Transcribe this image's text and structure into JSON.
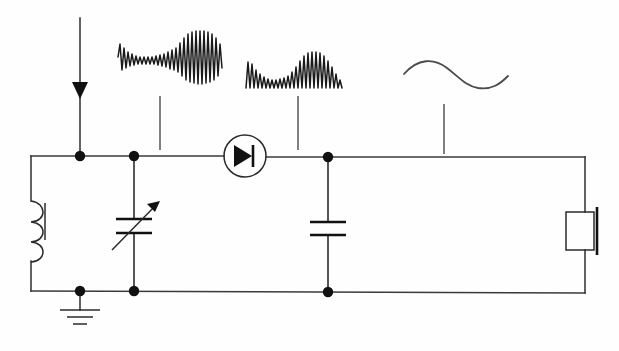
{
  "diagram": {
    "type": "schematic",
    "background_color": "#fefefe",
    "wire_color": "#3a3a3a",
    "component_color": "#111111",
    "waveform_color": "#1a1a1a",
    "pointer_color": "#6a6a6a",
    "canvas": {
      "width": 619,
      "height": 351
    }
  },
  "signal_source": {
    "name": "antenna-input",
    "label": "",
    "arrow_direction": "down",
    "x": 80,
    "y_top": 18,
    "y_arrow": 92,
    "y_bottom": 156
  },
  "rails": {
    "top_y": 156,
    "bottom_y": 292,
    "left_x": 31,
    "right_x": 585
  },
  "nodes": [
    {
      "name": "node-antenna-top",
      "x": 80,
      "y": 156
    },
    {
      "name": "node-tuning-top",
      "x": 134,
      "y": 156
    },
    {
      "name": "node-filter-top",
      "x": 328,
      "y": 156
    },
    {
      "name": "node-antenna-bottom",
      "x": 80,
      "y": 292
    },
    {
      "name": "node-tuning-bottom",
      "x": 134,
      "y": 292
    },
    {
      "name": "node-filter-bottom",
      "x": 328,
      "y": 292
    }
  ],
  "components": [
    {
      "name": "inductor",
      "symbol": "coil",
      "label": "",
      "loops": 3,
      "has_core_bar": true,
      "x": 31,
      "y_top": 200,
      "y_bottom": 262
    },
    {
      "name": "variable-capacitor",
      "symbol": "variable-capacitor",
      "label": "",
      "plates": 2,
      "has_arrow": true,
      "arrow_direction": "up-right",
      "x": 134,
      "y_center": 225
    },
    {
      "name": "diode-detector",
      "symbol": "diode-in-circle",
      "label": "",
      "orientation": "cathode-right",
      "x": 245,
      "y": 156,
      "circle_radius": 21
    },
    {
      "name": "filter-capacitor",
      "symbol": "capacitor",
      "label": "",
      "plates": 2,
      "x": 328,
      "y_center": 228
    },
    {
      "name": "earphone",
      "symbol": "earphone-speaker",
      "label": "",
      "x": 585,
      "y_center": 231
    },
    {
      "name": "ground",
      "symbol": "ground",
      "label": "",
      "bars": 3,
      "x": 80,
      "y_top": 292,
      "y_bottom": 316
    }
  ],
  "waveforms": [
    {
      "name": "waveform-modulated-rf",
      "description": "amplitude modulated radio frequency carrier",
      "stage": "antenna / tuned circuit",
      "type": "am-carrier",
      "bipolar": true,
      "x": 118,
      "y": 28,
      "width": 104,
      "height": 56,
      "pointer": {
        "x": 160,
        "y_top": 96,
        "y_bottom": 150
      }
    },
    {
      "name": "waveform-rectified",
      "description": "half wave rectified modulated signal",
      "stage": "after diode detector",
      "type": "rectified-pulses",
      "bipolar": false,
      "x": 246,
      "y": 52,
      "width": 96,
      "height": 38,
      "pointer": {
        "x": 298,
        "y_top": 96,
        "y_bottom": 150
      }
    },
    {
      "name": "waveform-audio",
      "description": "smooth demodulated audio frequency signal",
      "stage": "after filter capacitor",
      "type": "sine",
      "bipolar": true,
      "x": 404,
      "y": 58,
      "width": 104,
      "height": 30,
      "pointer": {
        "x": 444,
        "y_top": 104,
        "y_bottom": 154
      }
    }
  ]
}
